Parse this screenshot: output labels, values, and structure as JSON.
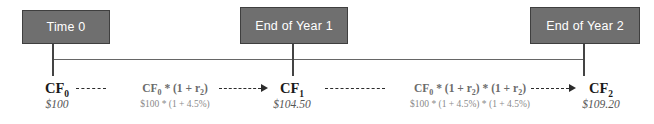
{
  "diagram": {
    "accent_color": "#6f6f6f",
    "border_color": "#3f3f3f",
    "axis_color": "#666666"
  },
  "milestones": [
    {
      "label": "Time 0"
    },
    {
      "label": "End of Year 1"
    },
    {
      "label": "End of Year 2"
    }
  ],
  "cashflows": [
    {
      "symbol": "CF",
      "subscript": "0",
      "amount": "$100"
    },
    {
      "symbol": "CF",
      "subscript": "1",
      "amount": "$104.50"
    },
    {
      "symbol": "CF",
      "subscript": "2",
      "amount": "$109.20"
    }
  ],
  "formulas": [
    {
      "prefix": "CF",
      "subscript": "0",
      "suffix": " * (1 + r",
      "rate_subscript": "2",
      "tail": ")",
      "numeric": "$100 * (1 + 4.5%)"
    },
    {
      "prefix": "CF",
      "subscript": "0",
      "suffix": " * (1 + r",
      "rate_subscript": "2",
      "tail": ") * (1 + r",
      "rate_subscript2": "2",
      "tail2": ")",
      "numeric": "$100 * (1 + 4.5%) * (1 + 4.5%)"
    }
  ]
}
